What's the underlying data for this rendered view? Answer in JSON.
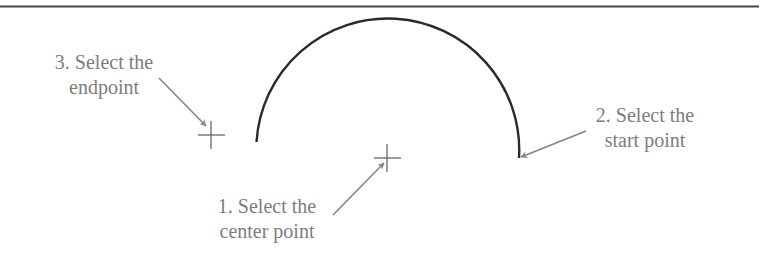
{
  "diagram": {
    "type": "arc-construction-steps",
    "colors": {
      "rule": "#444444",
      "arc": "#2a2a2a",
      "crosshair": "#666666",
      "arrow": "#858585",
      "text": "#7d7d7d"
    },
    "arc": {
      "cx": 387,
      "cy": 158,
      "r": 131,
      "start": [
        519,
        158
      ],
      "end": [
        256,
        142
      ]
    },
    "crosshairs": [
      {
        "name": "endpoint-crosshair",
        "x": 211,
        "y": 135
      },
      {
        "name": "center-crosshair",
        "x": 387,
        "y": 158
      }
    ],
    "steps": [
      {
        "id": 1,
        "line1": "1. Select the",
        "line2": "center point"
      },
      {
        "id": 2,
        "line1": "2. Select the",
        "line2": "start point"
      },
      {
        "id": 3,
        "line1": "3. Select the",
        "line2": "endpoint"
      }
    ]
  }
}
